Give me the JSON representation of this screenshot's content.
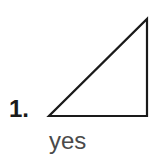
{
  "problem": {
    "number_label": "1.",
    "answer": "yes",
    "figure": {
      "shape": "right-triangle",
      "vertices": [
        [
          49,
          116
        ],
        [
          147,
          116
        ],
        [
          147,
          19
        ]
      ],
      "stroke_color": "#1a1a1a",
      "stroke_width": 2.2
    }
  }
}
